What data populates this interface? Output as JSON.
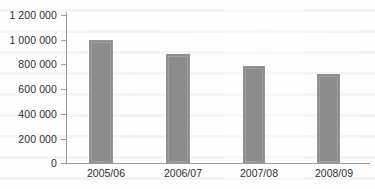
{
  "chart_data": {
    "type": "bar",
    "title": "",
    "subtitle": "",
    "xlabel": "",
    "ylabel": "",
    "categories": [
      "2005/06",
      "2006/07",
      "2007/08",
      "2008/09"
    ],
    "values": [
      1000000,
      890000,
      785000,
      720000
    ],
    "series": [
      {
        "name": "",
        "values": [
          1000000,
          890000,
          785000,
          720000
        ]
      }
    ],
    "ylim": [
      0,
      1200000
    ],
    "xlim": [
      0,
      4
    ],
    "ytick_values": [
      0,
      200000,
      400000,
      600000,
      800000,
      1000000,
      1200000
    ],
    "ytick_labels": [
      "0",
      "200 000",
      "400 000",
      "600 000",
      "800 000",
      "1 000 000",
      "1 200 000"
    ],
    "xtick_labels": [
      "2005/06",
      "2006/07",
      "2007/08",
      "2008/09"
    ],
    "grid": false,
    "legend": null,
    "legend_position": "none",
    "annotations": [],
    "colors": {
      "bar_fill": "#8c8c8c",
      "bar_border": "#949494",
      "axis_line": "#9b9b9b",
      "tick_text": "#2e2e2e",
      "background": "#fefefe"
    }
  }
}
